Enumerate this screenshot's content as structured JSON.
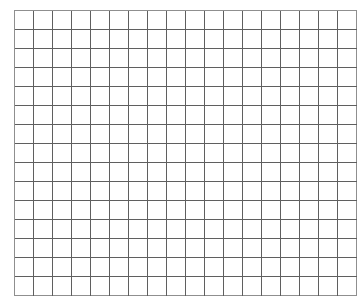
{
  "page": {
    "background_color": "#ffffff"
  },
  "grid": {
    "name": "blank-graph-paper-grid",
    "columns": 18,
    "rows": 15,
    "cell_width_px": 18,
    "cell_height_px": 18,
    "origin_x_px": 14,
    "origin_y_px": 10,
    "total_width_px": 324,
    "total_height_px": 270,
    "line_color": "#5f5f5f",
    "border_color": "#8f8f8f",
    "cell_fill_color": "#ffffff",
    "line_width_px": 1,
    "cell_text": ""
  },
  "chart_data": {
    "type": "table",
    "title": "",
    "xlabel": "",
    "ylabel": "",
    "columns": 18,
    "rows": 15,
    "headers": [],
    "values": [],
    "grid": true,
    "legend": "none"
  }
}
